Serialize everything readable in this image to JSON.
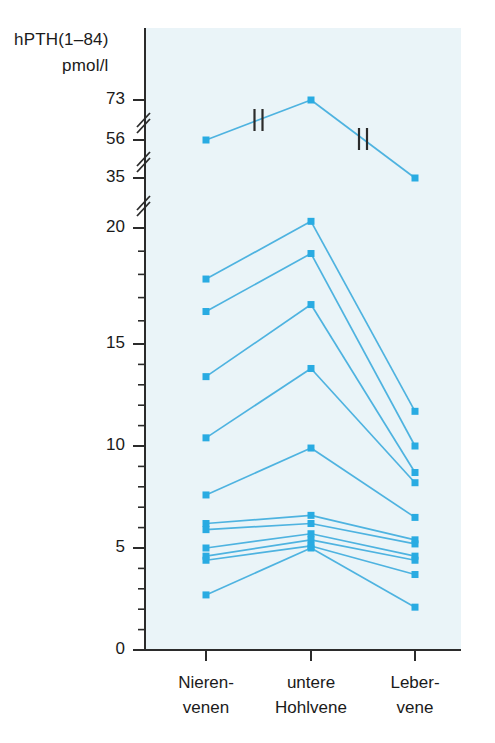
{
  "chart_data": {
    "type": "line",
    "title": "",
    "subtitle": "",
    "ylabel_line1": "hPTH(1–84)",
    "ylabel_line2": "pmol/l",
    "xlabel": "",
    "categories": [
      "Nieren-\nvenen",
      "untere\nHohlvene",
      "Leber-\nvene"
    ],
    "category_labels": [
      {
        "line1": "Nieren-",
        "line2": "venen"
      },
      {
        "line1": "untere",
        "line2": "Hohlvene"
      },
      {
        "line1": "Leber-",
        "line2": "vene"
      }
    ],
    "ytick_labels": [
      "73",
      "56",
      "35",
      "20",
      "15",
      "10",
      "5",
      "0"
    ],
    "ytick_values": [
      73,
      56,
      35,
      20,
      15,
      10,
      5,
      0
    ],
    "ylim": [
      0,
      73
    ],
    "axis_breaks": [
      {
        "between": [
          20,
          35
        ]
      },
      {
        "between": [
          35,
          56
        ]
      },
      {
        "between": [
          56,
          73
        ]
      }
    ],
    "grid": false,
    "legend": "none",
    "minor_tick_step": 1,
    "series": [
      {
        "name": "patient-1",
        "values": [
          56.0,
          73.0,
          35.0
        ],
        "segment_breaks": [
          true,
          true
        ]
      },
      {
        "name": "patient-2",
        "values": [
          17.8,
          22.0,
          11.7
        ],
        "segment_breaks": [
          false,
          false
        ]
      },
      {
        "name": "patient-3",
        "values": [
          16.4,
          18.9,
          10.0
        ],
        "segment_breaks": [
          false,
          false
        ]
      },
      {
        "name": "patient-4",
        "values": [
          13.4,
          16.7,
          8.7
        ],
        "segment_breaks": [
          false,
          false
        ]
      },
      {
        "name": "patient-5",
        "values": [
          10.4,
          13.8,
          8.2
        ],
        "segment_breaks": [
          false,
          false
        ]
      },
      {
        "name": "patient-6",
        "values": [
          7.6,
          9.9,
          6.5
        ],
        "segment_breaks": [
          false,
          false
        ]
      },
      {
        "name": "patient-7",
        "values": [
          6.2,
          6.6,
          5.4
        ],
        "segment_breaks": [
          false,
          false
        ]
      },
      {
        "name": "patient-8",
        "values": [
          5.9,
          6.2,
          5.2
        ],
        "segment_breaks": [
          false,
          false
        ]
      },
      {
        "name": "patient-9",
        "values": [
          5.0,
          5.7,
          4.6
        ],
        "segment_breaks": [
          false,
          false
        ]
      },
      {
        "name": "patient-10",
        "values": [
          4.6,
          5.4,
          4.4
        ],
        "segment_breaks": [
          false,
          false
        ]
      },
      {
        "name": "patient-11",
        "values": [
          4.4,
          5.1,
          3.7
        ],
        "segment_breaks": [
          false,
          false
        ]
      },
      {
        "name": "patient-12",
        "values": [
          2.7,
          5.0,
          2.1
        ],
        "segment_breaks": [
          false,
          false
        ]
      }
    ],
    "colors": {
      "line": "#4EB3E0",
      "marker": "#29ABE2",
      "axis": "#2b2b2b",
      "plot_background": "#eaf4f8",
      "page_background": "#ffffff",
      "break_mark": "#2b2b2b"
    }
  }
}
